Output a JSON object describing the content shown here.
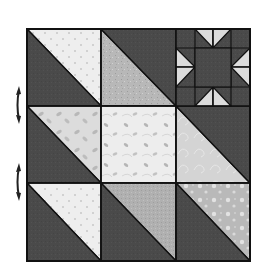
{
  "colors": {
    "background": "#ffffff",
    "dark": "#4a4a4a",
    "outline": "#111111",
    "light_dots": "#eeeeee",
    "light_floral": "#d8d8d8",
    "light_mottled": "#b9b9b9",
    "light_leaf": "#ebebeb",
    "light_swirl": "#d4d4d4",
    "light_gray": "#b0b0b0",
    "light_bubble": "#bdbdbd",
    "star_point": "#dcdcdc",
    "arrow": "#222222"
  },
  "block": {
    "x": 27,
    "y": 29,
    "size_x": 223,
    "size_y": 232,
    "cols": [
      27,
      101,
      176,
      250
    ],
    "rows": [
      29,
      106,
      183,
      261
    ]
  },
  "cells": [
    {
      "name": "cell-r1c1-half-square-triangle",
      "row": 0,
      "col": 0,
      "type": "hst",
      "dark_side": "bottom-left",
      "light": "light_dots"
    },
    {
      "name": "cell-r1c2-half-square-triangle",
      "row": 0,
      "col": 1,
      "type": "hst",
      "dark_side": "top-right",
      "light": "light_mottled"
    },
    {
      "name": "cell-r1c3-sawtooth-star",
      "row": 0,
      "col": 2,
      "type": "star"
    },
    {
      "name": "cell-r2c1-half-square-triangle",
      "row": 1,
      "col": 0,
      "type": "hst",
      "dark_side": "bottom-left",
      "light": "light_floral"
    },
    {
      "name": "cell-r2c2-solid-square",
      "row": 1,
      "col": 1,
      "type": "solid",
      "light": "light_leaf"
    },
    {
      "name": "cell-r2c3-half-square-triangle",
      "row": 1,
      "col": 2,
      "type": "hst",
      "dark_side": "top-right",
      "light": "light_swirl"
    },
    {
      "name": "cell-r3c1-half-square-triangle",
      "row": 2,
      "col": 0,
      "type": "hst",
      "dark_side": "bottom-left",
      "light": "light_dots"
    },
    {
      "name": "cell-r3c2-half-square-triangle",
      "row": 2,
      "col": 1,
      "type": "hst",
      "dark_side": "bottom-left",
      "light": "light_gray"
    },
    {
      "name": "cell-r3c3-half-square-triangle",
      "row": 2,
      "col": 2,
      "type": "hst",
      "dark_side": "bottom-left",
      "light": "light_bubble"
    }
  ],
  "star": {
    "grid_x": [
      176,
      195,
      213,
      231,
      250
    ],
    "grid_y": [
      29,
      48,
      67,
      87,
      106
    ],
    "points": [
      [
        [
          195,
          29
        ],
        [
          213,
          29
        ],
        [
          213,
          48
        ]
      ],
      [
        [
          213,
          29
        ],
        [
          231,
          29
        ],
        [
          213,
          48
        ]
      ],
      [
        [
          176,
          48
        ],
        [
          176,
          67
        ],
        [
          195,
          67
        ]
      ],
      [
        [
          176,
          67
        ],
        [
          176,
          87
        ],
        [
          195,
          67
        ]
      ],
      [
        [
          250,
          48
        ],
        [
          250,
          67
        ],
        [
          231,
          67
        ]
      ],
      [
        [
          250,
          67
        ],
        [
          250,
          87
        ],
        [
          231,
          67
        ]
      ],
      [
        [
          195,
          106
        ],
        [
          213,
          106
        ],
        [
          213,
          87
        ]
      ],
      [
        [
          213,
          106
        ],
        [
          231,
          106
        ],
        [
          213,
          87
        ]
      ]
    ]
  },
  "arrows": [
    {
      "name": "rotate-arrow-icon-row1",
      "x": 19,
      "y_top": 86,
      "y_bottom": 124
    },
    {
      "name": "rotate-arrow-icon-row2",
      "x": 19,
      "y_top": 163,
      "y_bottom": 201
    }
  ]
}
